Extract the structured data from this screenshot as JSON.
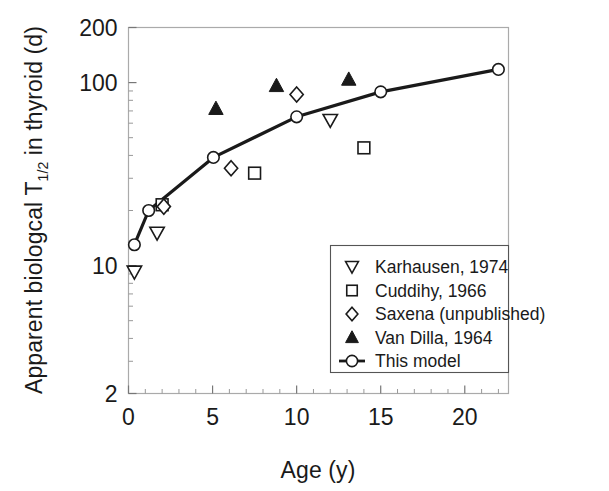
{
  "figure": {
    "background_color": "#ffffff",
    "ink_color": "#1a1a1a",
    "frame_color": "#9a9a9a"
  },
  "chart_data": {
    "type": "scatter",
    "title": "",
    "subtitle": "",
    "xlabel": "Age (y)",
    "ylabel": "Apparent biologcal T1/2 in thyroid (d)",
    "ylabel_parts": {
      "prefix": "Apparent biologcal T",
      "subscript": "1/2",
      "suffix": " in thyroid (d)"
    },
    "x_scale": "linear",
    "y_scale": "log",
    "xlim": [
      0,
      22.6
    ],
    "ylim": [
      2,
      200
    ],
    "x_ticks": [
      0,
      5,
      10,
      15,
      20
    ],
    "x_tick_labels": [
      "0",
      "5",
      "10",
      "15",
      "20"
    ],
    "x_minor_ticks": [
      1,
      2,
      3,
      4,
      6,
      7,
      8,
      9,
      11,
      12,
      13,
      14,
      16,
      17,
      18,
      19,
      21,
      22
    ],
    "y_ticks": [
      2,
      10,
      100,
      200
    ],
    "y_tick_labels": [
      "2",
      "10",
      "100",
      "200"
    ],
    "y_minor_ticks": [
      3,
      4,
      5,
      6,
      7,
      8,
      9,
      20,
      30,
      40,
      50,
      60,
      70,
      80,
      90
    ],
    "grid": false,
    "legend_position": "lower-right",
    "series": [
      {
        "name": "Karhausen, 1974",
        "marker": "triangle-down-open",
        "filled": false,
        "line": false,
        "points": [
          {
            "x": 0.35,
            "y": 9.2
          },
          {
            "x": 1.7,
            "y": 15.0
          },
          {
            "x": 12.0,
            "y": 62.0
          }
        ]
      },
      {
        "name": "Cuddihy, 1966",
        "marker": "square-open",
        "filled": false,
        "line": false,
        "points": [
          {
            "x": 2.0,
            "y": 21.5
          },
          {
            "x": 7.5,
            "y": 32.0
          },
          {
            "x": 14.0,
            "y": 44.0
          }
        ]
      },
      {
        "name": "Saxena (unpublished)",
        "marker": "diamond-open",
        "filled": false,
        "line": false,
        "points": [
          {
            "x": 2.1,
            "y": 21.0
          },
          {
            "x": 6.1,
            "y": 34.0
          },
          {
            "x": 10.0,
            "y": 86.0
          }
        ]
      },
      {
        "name": "Van Dilla, 1964",
        "marker": "triangle-up-filled",
        "filled": true,
        "line": false,
        "points": [
          {
            "x": 5.2,
            "y": 72.0
          },
          {
            "x": 8.8,
            "y": 96.0
          },
          {
            "x": 13.1,
            "y": 104.0
          }
        ]
      },
      {
        "name": "This model",
        "marker": "circle-open",
        "filled": false,
        "line": true,
        "points": [
          {
            "x": 0.35,
            "y": 13.0
          },
          {
            "x": 1.2,
            "y": 20.0
          },
          {
            "x": 5.05,
            "y": 39.0
          },
          {
            "x": 10.0,
            "y": 65.0
          },
          {
            "x": 15.0,
            "y": 89.0
          },
          {
            "x": 22.0,
            "y": 118.0
          }
        ]
      }
    ]
  },
  "legend": {
    "items": [
      {
        "label": "Karhausen, 1974",
        "marker": "triangle-down-open"
      },
      {
        "label": "Cuddihy, 1966",
        "marker": "square-open"
      },
      {
        "label": "Saxena (unpublished)",
        "marker": "diamond-open"
      },
      {
        "label": "Van Dilla, 1964",
        "marker": "triangle-up-filled"
      },
      {
        "label": "This model",
        "marker": "line-circle"
      }
    ]
  }
}
